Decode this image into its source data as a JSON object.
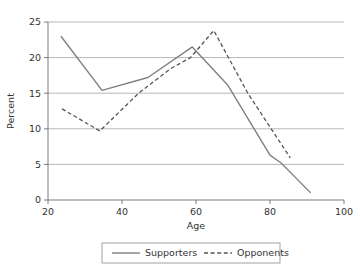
{
  "chart_data": {
    "type": "line",
    "title": "",
    "subtitle": "",
    "xlabel": "Age",
    "ylabel": "Percent",
    "xlim": [
      20,
      100
    ],
    "ylim": [
      0,
      25
    ],
    "xticks": [
      20,
      40,
      60,
      80,
      100
    ],
    "yticks": [
      0,
      5,
      10,
      15,
      20,
      25
    ],
    "xticklabels": [
      "20",
      "40",
      "60",
      "80",
      "100"
    ],
    "yticklabels": [
      "0",
      "5",
      "10",
      "15",
      "20",
      "25"
    ],
    "grid": "horizontal",
    "legend_position": "bottom-outside",
    "series": [
      {
        "name": "Supporters",
        "style": "solid",
        "color": "#808080",
        "x": [
          23.5,
          34.6,
          47,
          59,
          68.5,
          80,
          83,
          91
        ],
        "y": [
          23.0,
          15.4,
          17.2,
          21.5,
          16.2,
          6.3,
          5.2,
          1.0
        ]
      },
      {
        "name": "Opponents",
        "style": "dashed",
        "color": "#555555",
        "x": [
          23.8,
          34,
          44.5,
          53,
          58.5,
          64.8,
          74,
          85.5
        ],
        "y": [
          12.8,
          9.7,
          15.0,
          18.4,
          20.0,
          23.8,
          15.0,
          5.9
        ]
      }
    ]
  },
  "legend": {
    "entries": [
      {
        "label": "Supporters",
        "style": "solid"
      },
      {
        "label": "Opponents",
        "style": "dashed"
      }
    ]
  },
  "axes": {
    "x_title": "Age",
    "y_title": "Percent"
  },
  "colors": {
    "supporters_line": "#808080",
    "opponents_line": "#555555",
    "grid": "#9a9a9a",
    "axis": "#6e6e6e",
    "text": "#333333",
    "background": "#ffffff"
  }
}
